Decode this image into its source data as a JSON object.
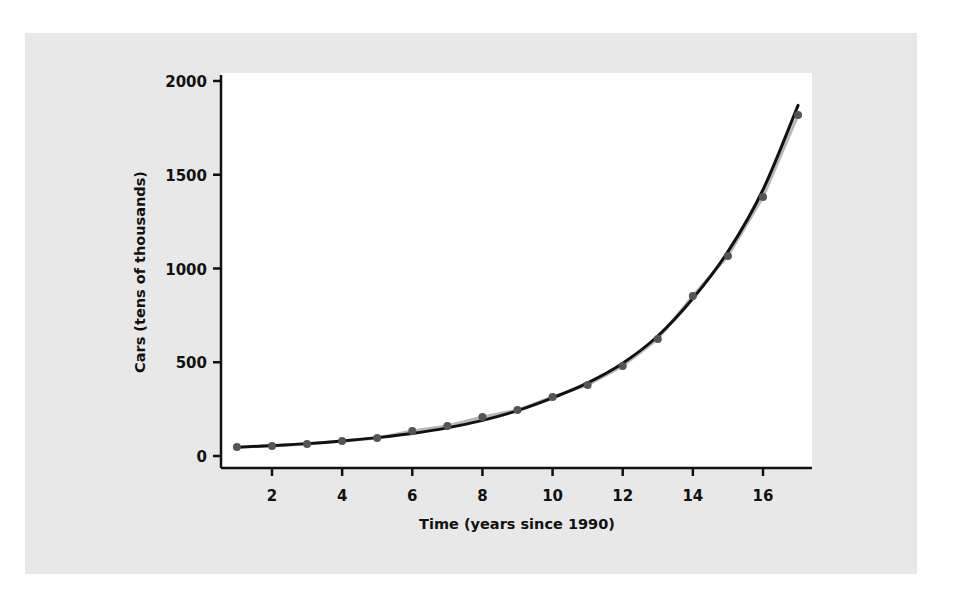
{
  "chart_data": {
    "type": "scatter",
    "title": "",
    "xlabel": "Time (years since 1990)",
    "ylabel": "Cars (tens of thousands)",
    "xlim": [
      0.6,
      17.4
    ],
    "ylim": [
      -60,
      2040
    ],
    "x_ticks": [
      2,
      4,
      6,
      8,
      10,
      12,
      14,
      16
    ],
    "y_ticks": [
      0,
      500,
      1000,
      1500,
      2000
    ],
    "grid": false,
    "legend": null,
    "series": [
      {
        "name": "Data",
        "type": "scatter",
        "color": "#555555",
        "x": [
          1,
          2,
          3,
          4,
          5,
          6,
          7,
          8,
          9,
          10,
          11,
          12,
          13,
          14,
          15,
          16,
          17
        ],
        "y": [
          48,
          53,
          64,
          80,
          96,
          133,
          160,
          208,
          245,
          315,
          379,
          480,
          624,
          853,
          1067,
          1381,
          1819
        ]
      },
      {
        "name": "Exponential fit",
        "type": "line",
        "color": "#111111",
        "x": [
          1,
          2,
          3,
          4,
          5,
          6,
          7,
          8,
          9,
          10,
          11,
          12,
          13,
          14,
          15,
          16,
          17
        ],
        "y": [
          46,
          56,
          66,
          80,
          98,
          120,
          150,
          190,
          242,
          310,
          390,
          495,
          640,
          840,
          1090,
          1420,
          1870
        ]
      }
    ]
  },
  "colors": {
    "panel": "#e8e8e8",
    "plot_bg": "#ffffff",
    "axis": "#111111",
    "point": "#555555",
    "connector": "#b8b8b8",
    "fit_line": "#111111"
  }
}
